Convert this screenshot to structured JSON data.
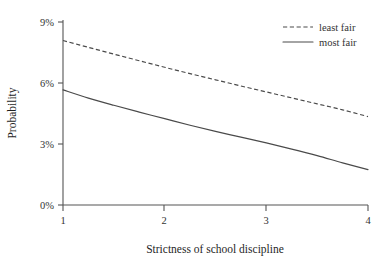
{
  "chart_data": {
    "type": "line",
    "title": "",
    "xlabel": "Strictness of school discipline",
    "ylabel": "Probability",
    "xlim": [
      1,
      4
    ],
    "ylim": [
      0,
      9
    ],
    "grid": false,
    "legend_position": "top-right",
    "x_ticks": [
      "1",
      "2",
      "3",
      "4"
    ],
    "x_tick_values": [
      1,
      2,
      3,
      4
    ],
    "y_ticks": [
      "0%",
      "3%",
      "6%",
      "9%"
    ],
    "y_tick_values": [
      0,
      3,
      6,
      9
    ],
    "x": [
      1,
      1.25,
      1.5,
      1.75,
      2,
      2.25,
      2.5,
      2.75,
      3,
      3.25,
      3.5,
      3.75,
      4
    ],
    "series": [
      {
        "name": "least fair",
        "style": "dashed",
        "color": "#4a4a4a",
        "values": [
          8.0,
          7.67,
          7.34,
          7.02,
          6.7,
          6.39,
          6.09,
          5.79,
          5.5,
          5.21,
          4.92,
          4.63,
          4.3
        ]
      },
      {
        "name": "most fair",
        "style": "solid",
        "color": "#4a4a4a",
        "values": [
          5.6,
          5.2,
          4.85,
          4.52,
          4.2,
          3.88,
          3.58,
          3.3,
          3.02,
          2.72,
          2.4,
          2.05,
          1.72
        ]
      }
    ]
  },
  "legend": {
    "entries": [
      {
        "label": "least fair",
        "style": "dashed"
      },
      {
        "label": "most fair",
        "style": "solid"
      }
    ]
  },
  "axes": {
    "x_title": "Strictness of school discipline",
    "y_title": "Probability"
  }
}
